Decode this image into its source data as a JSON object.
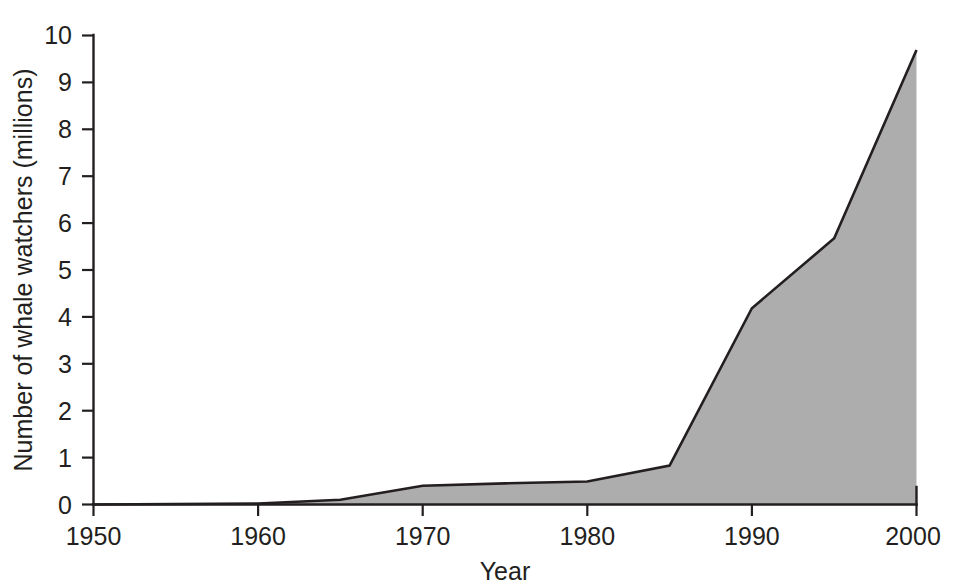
{
  "chart_data": {
    "type": "area",
    "title": "",
    "subtitle": "",
    "xlabel": "Year",
    "ylabel": "Number of whale watchers (millions)",
    "xlim": [
      1950,
      2000
    ],
    "ylim": [
      0,
      10
    ],
    "grid": false,
    "legend": false,
    "legend_position": "none",
    "x_ticks": [
      1950,
      1960,
      1970,
      1980,
      1990,
      2000
    ],
    "x_tick_labels": [
      "1950",
      "1960",
      "1970",
      "1980",
      "1990",
      "2000"
    ],
    "y_ticks": [
      0,
      1,
      2,
      3,
      4,
      5,
      6,
      7,
      8,
      9,
      10
    ],
    "y_tick_labels": [
      "0",
      "1",
      "2",
      "3",
      "4",
      "5",
      "6",
      "7",
      "8",
      "9",
      "10"
    ],
    "fill_color": "#adadad",
    "line_color": "#231f20",
    "background_color": "#ffffff",
    "x": [
      1950,
      1960,
      1965,
      1970,
      1975,
      1980,
      1985,
      1990,
      1995,
      2000
    ],
    "values": [
      0.0,
      0.02,
      0.1,
      0.4,
      0.45,
      0.49,
      0.83,
      4.18,
      5.67,
      9.68
    ],
    "series": [
      {
        "name": "Number of whale watchers (millions)",
        "x": [
          1950,
          1960,
          1965,
          1970,
          1975,
          1980,
          1985,
          1990,
          1995,
          2000
        ],
        "values": [
          0.0,
          0.02,
          0.1,
          0.4,
          0.45,
          0.49,
          0.83,
          4.18,
          5.67,
          9.68
        ]
      }
    ],
    "annotations": []
  },
  "axes": {
    "x_title": "Year",
    "y_title": "Number of whale watchers (millions)"
  },
  "x_tick_labels": {
    "t0": "1950",
    "t1": "1960",
    "t2": "1970",
    "t3": "1980",
    "t4": "1990",
    "t5": "2000"
  },
  "y_tick_labels": {
    "v0": "0",
    "v1": "1",
    "v2": "2",
    "v3": "3",
    "v4": "4",
    "v5": "5",
    "v6": "6",
    "v7": "7",
    "v8": "8",
    "v9": "9",
    "v10": "10"
  }
}
